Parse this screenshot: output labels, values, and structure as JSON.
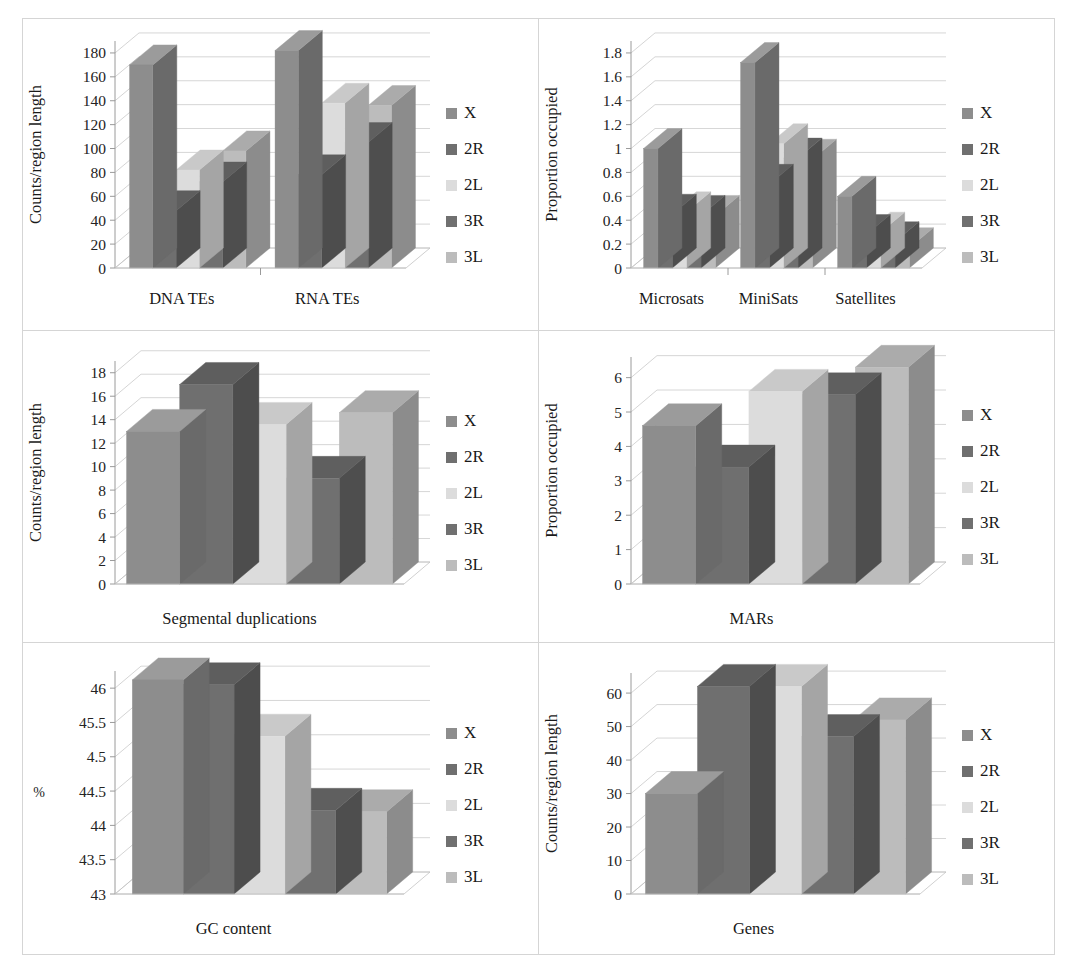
{
  "figure": {
    "title": "",
    "panel_count": 6,
    "series_labels": [
      "X",
      "2R",
      "2L",
      "3R",
      "3L"
    ],
    "series_colors": {
      "X": "#8d8d8d",
      "2R": "#6f6f6f",
      "2L": "#dcdcdc",
      "3R": "#707070",
      "3L": "#bcbcbc"
    },
    "top_face_colors": {
      "X": "#9b9b9b",
      "2R": "#5e5e5e",
      "2L": "#c9c9c9",
      "3R": "#5f5f5f",
      "3L": "#ababab"
    },
    "side_face_colors": {
      "X": "#6a6a6a",
      "2R": "#4d4d4d",
      "2L": "#a5a5a5",
      "3R": "#4e4e4e",
      "3L": "#8c8c8c"
    }
  },
  "chart_data": [
    {
      "id": "dna-rna-tes",
      "type": "bar",
      "title": "",
      "xlabel": "",
      "ylabel": "Counts/region length",
      "categories": [
        "DNA TEs",
        "RNA TEs"
      ],
      "ticks": [
        0,
        20,
        40,
        60,
        80,
        100,
        120,
        140,
        160,
        180
      ],
      "tick_labels": [
        "0",
        "20",
        "40",
        "60",
        "80",
        "100",
        "120",
        "140",
        "160",
        "180"
      ],
      "ylim": [
        0,
        190
      ],
      "grid": true,
      "legend": "right",
      "series": [
        {
          "name": "X",
          "values": [
            170,
            182
          ]
        },
        {
          "name": "2R",
          "values": [
            48,
            78
          ]
        },
        {
          "name": "2L",
          "values": [
            82,
            138
          ]
        },
        {
          "name": "3R",
          "values": [
            72,
            105
          ]
        },
        {
          "name": "3L",
          "values": [
            98,
            136
          ]
        }
      ]
    },
    {
      "id": "repeats",
      "type": "bar",
      "title": "",
      "xlabel": "",
      "ylabel": "Proportion occupied",
      "categories": [
        "Microsats",
        "MiniSats",
        "Satellites"
      ],
      "ticks": [
        0,
        0.2,
        0.4,
        0.6,
        0.8,
        1,
        1.2,
        1.4,
        1.6,
        1.8
      ],
      "tick_labels": [
        "0",
        "0.2",
        "0.4",
        "0.6",
        "0.8",
        "1",
        "1.2",
        "1.4",
        "1.6",
        "1.8"
      ],
      "ylim": [
        0,
        1.9
      ],
      "grid": true,
      "legend": "right",
      "series": [
        {
          "name": "X",
          "values": [
            1.0,
            1.72,
            0.6
          ]
        },
        {
          "name": "2R",
          "values": [
            0.45,
            0.7,
            0.28
          ]
        },
        {
          "name": "2L",
          "values": [
            0.47,
            1.04,
            0.3
          ]
        },
        {
          "name": "3R",
          "values": [
            0.44,
            0.92,
            0.22
          ]
        },
        {
          "name": "3L",
          "values": [
            0.44,
            0.91,
            0.17
          ]
        }
      ]
    },
    {
      "id": "segmental-duplications",
      "type": "bar",
      "title": "",
      "xlabel": "",
      "ylabel": "Counts/region length",
      "categories": [
        "Segmental duplications"
      ],
      "ticks": [
        0,
        2,
        4,
        6,
        8,
        10,
        12,
        14,
        16,
        18
      ],
      "tick_labels": [
        "0",
        "2",
        "4",
        "6",
        "8",
        "10",
        "12",
        "14",
        "16",
        "18"
      ],
      "ylim": [
        0,
        19
      ],
      "grid": true,
      "legend": "right",
      "series": [
        {
          "name": "X",
          "values": [
            13.0
          ]
        },
        {
          "name": "2R",
          "values": [
            17.0
          ]
        },
        {
          "name": "2L",
          "values": [
            13.6
          ]
        },
        {
          "name": "3R",
          "values": [
            9.0
          ]
        },
        {
          "name": "3L",
          "values": [
            14.6
          ]
        }
      ]
    },
    {
      "id": "mars",
      "type": "bar",
      "title": "",
      "xlabel": "",
      "ylabel": "Proportion occupied",
      "categories": [
        "MARs"
      ],
      "ticks": [
        0,
        1,
        2,
        3,
        4,
        5,
        6
      ],
      "tick_labels": [
        "0",
        "1",
        "2",
        "3",
        "4",
        "5",
        "6"
      ],
      "ylim": [
        0,
        6.6
      ],
      "grid": true,
      "legend": "right",
      "series": [
        {
          "name": "X",
          "values": [
            4.6
          ]
        },
        {
          "name": "2R",
          "values": [
            3.4
          ]
        },
        {
          "name": "2L",
          "values": [
            5.6
          ]
        },
        {
          "name": "3R",
          "values": [
            5.5
          ]
        },
        {
          "name": "3L",
          "values": [
            6.3
          ]
        }
      ]
    },
    {
      "id": "gc-content",
      "type": "bar",
      "title": "",
      "xlabel": "",
      "ylabel": "%",
      "categories": [
        "GC content"
      ],
      "ticks": [
        43,
        43.5,
        44,
        44.5,
        45,
        45.5,
        46
      ],
      "tick_labels": [
        "43",
        "43.5",
        "44",
        "44.5",
        "4.5",
        "45.5",
        "46"
      ],
      "ylim": [
        43,
        46.25
      ],
      "grid": true,
      "legend": "right",
      "series": [
        {
          "name": "X",
          "values": [
            46.12
          ]
        },
        {
          "name": "2R",
          "values": [
            46.05
          ]
        },
        {
          "name": "2L",
          "values": [
            45.3
          ]
        },
        {
          "name": "3R",
          "values": [
            44.22
          ]
        },
        {
          "name": "3L",
          "values": [
            44.2
          ]
        }
      ]
    },
    {
      "id": "genes",
      "type": "bar",
      "title": "",
      "xlabel": "",
      "ylabel": "Counts/region length",
      "categories": [
        "Genes"
      ],
      "ticks": [
        0,
        10,
        20,
        30,
        40,
        50,
        60
      ],
      "tick_labels": [
        "0",
        "10",
        "20",
        "30",
        "40",
        "50",
        "60"
      ],
      "ylim": [
        0,
        66
      ],
      "grid": true,
      "legend": "right",
      "series": [
        {
          "name": "X",
          "values": [
            30
          ]
        },
        {
          "name": "2R",
          "values": [
            62
          ]
        },
        {
          "name": "2L",
          "values": [
            62
          ]
        },
        {
          "name": "3R",
          "values": [
            47
          ]
        },
        {
          "name": "3L",
          "values": [
            52
          ]
        }
      ]
    }
  ]
}
